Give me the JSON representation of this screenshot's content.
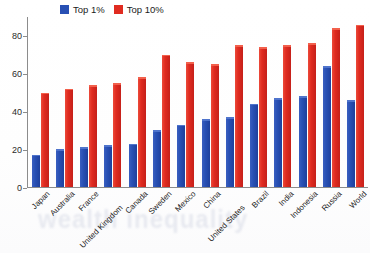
{
  "chart_data": {
    "type": "bar",
    "title": "",
    "subtitle": "",
    "xlabel": "",
    "ylabel": "",
    "ylim": [
      0,
      90
    ],
    "yticks": [
      0,
      20,
      40,
      60,
      80
    ],
    "grid": false,
    "legend_position": "top-left",
    "categories": [
      "Japan",
      "Australia",
      "France",
      "United Kingdom",
      "Canada",
      "Sweden",
      "Mexico",
      "China",
      "United States",
      "Brazil",
      "India",
      "Indonesia",
      "Russia",
      "World"
    ],
    "series": [
      {
        "name": "Top 1%",
        "color": "#2850b4",
        "values": [
          17,
          20,
          21,
          22,
          23,
          30,
          33,
          36,
          37,
          44,
          47,
          48,
          64,
          46
        ]
      },
      {
        "name": "Top 10%",
        "color": "#e02b20",
        "values": [
          50,
          52,
          54,
          55,
          58,
          70,
          66,
          65,
          75,
          74,
          75,
          76,
          84,
          86
        ]
      }
    ]
  },
  "legend": {
    "items": [
      {
        "label": "Top 1%",
        "color": "#2850b4",
        "swatch_name": "legend-swatch-top-1"
      },
      {
        "label": "Top 10%",
        "color": "#e02b20",
        "swatch_name": "legend-swatch-top-10"
      }
    ]
  },
  "watermark": {
    "text": "wealth inequality"
  }
}
